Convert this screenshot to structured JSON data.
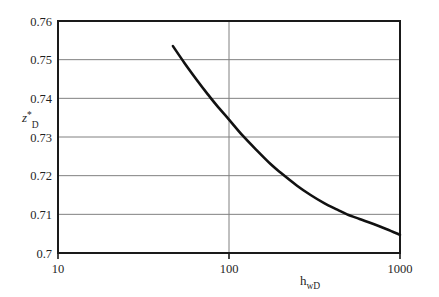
{
  "chart_data": {
    "type": "line",
    "title": "",
    "subtitle": "",
    "xlabel": "h_wD",
    "xlabel_base": "h",
    "xlabel_sub": "wD",
    "ylabel": "z*_D",
    "ylabel_base": "z",
    "ylabel_sup": "*",
    "ylabel_sub": "D",
    "xscale": "log",
    "yscale": "linear",
    "xlim": [
      10,
      1000
    ],
    "ylim": [
      0.7,
      0.76
    ],
    "grid": true,
    "grid_axis": "y-major-and-x-major",
    "legend": "none",
    "xticks": [
      10,
      100,
      1000
    ],
    "xtick_labels": [
      "10",
      "100",
      "1000"
    ],
    "yticks": [
      0.7,
      0.71,
      0.72,
      0.73,
      0.74,
      0.75,
      0.76
    ],
    "ytick_labels": [
      "0.7",
      "0.71",
      "0.72",
      "0.73",
      "0.74",
      "0.75",
      "0.76"
    ],
    "series": [
      {
        "name": "zD*",
        "color": "#111111",
        "linewidth": 2.6,
        "x": [
          47,
          55,
          65,
          75,
          85,
          100,
          120,
          145,
          175,
          200,
          250,
          300,
          360,
          430,
          490,
          580,
          700,
          830,
          1000
        ],
        "y": [
          0.7535,
          0.7491,
          0.7447,
          0.7411,
          0.7381,
          0.7345,
          0.7304,
          0.7266,
          0.723,
          0.7208,
          0.7174,
          0.715,
          0.7129,
          0.7112,
          0.71,
          0.7088,
          0.7075,
          0.7062,
          0.7047
        ]
      }
    ]
  },
  "axes": {
    "frame_color": "#1a1a1a",
    "grid_color": "#808080",
    "background": "#ffffff"
  }
}
